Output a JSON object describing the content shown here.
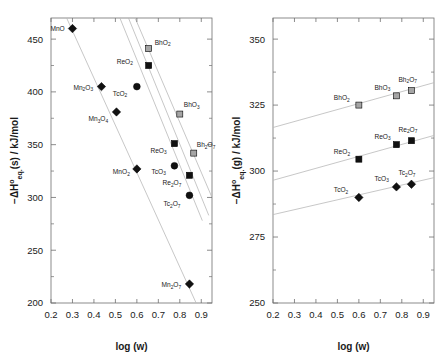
{
  "figure": {
    "panels": [
      "left",
      "right"
    ],
    "background": "#ffffff",
    "series_colors": {
      "Mn": "#111111",
      "Tc": "#111111",
      "Re": "#111111",
      "Bh": "#9a9a9a",
      "line": "#b9b9b9",
      "axis": "#6f6f6f"
    }
  },
  "chart_data": [
    {
      "type": "scatter",
      "panel": "left",
      "title": "",
      "xlabel": "log (w)",
      "ylabel": "−ΔH°eq(s) / kJ/mol",
      "ylabel_parts": {
        "prefix": "−ΔH",
        "sup": "o",
        "sub": "eq.",
        "state": "(s)",
        "units": " / kJ/mol"
      },
      "xlim": [
        0.2,
        0.95
      ],
      "ylim": [
        200,
        470
      ],
      "xticks": [
        0.2,
        0.3,
        0.4,
        0.5,
        0.6,
        0.7,
        0.8,
        0.9
      ],
      "xticklabels": [
        "0.2",
        "0.3",
        "0.4",
        "0.5",
        "0.6",
        "0.7",
        "0.8",
        "0.9"
      ],
      "yticks": [
        200,
        250,
        300,
        350,
        400,
        450
      ],
      "yticklabels": [
        "200",
        "250",
        "300",
        "350",
        "400",
        "450"
      ],
      "yminorticks": [
        225,
        275,
        325,
        375,
        425
      ],
      "grid": false,
      "legend": false,
      "series": [
        {
          "name": "Mn oxides",
          "marker": "diamond",
          "fill": "#111111",
          "points": [
            {
              "label": "MnO",
              "label_sub": "",
              "x": 0.3,
              "y": 460,
              "label_dx": -22,
              "label_dy": 2
            },
            {
              "label": "Mn",
              "label_sub": "2O3",
              "x": 0.435,
              "y": 405,
              "label_dx": -28,
              "label_dy": 3
            },
            {
              "label": "Mn",
              "label_sub": "3O4",
              "x": 0.505,
              "y": 381,
              "label_dx": -28,
              "label_dy": 9
            },
            {
              "label": "MnO",
              "label_sub": "2",
              "x": 0.6,
              "y": 327,
              "label_dx": -24,
              "label_dy": 5
            },
            {
              "label": "Mn",
              "label_sub": "2O7",
              "x": 0.845,
              "y": 218,
              "label_dx": -28,
              "label_dy": 3
            }
          ]
        },
        {
          "name": "Tc oxides",
          "marker": "circle",
          "fill": "#111111",
          "points": [
            {
              "label": "TcO",
              "label_sub": "2",
              "x": 0.6,
              "y": 405,
              "label_dx": -24,
              "label_dy": 9
            },
            {
              "label": "TcO",
              "label_sub": "3",
              "x": 0.775,
              "y": 330,
              "label_dx": -23,
              "label_dy": 8
            },
            {
              "label": "Tc",
              "label_sub": "2O7",
              "x": 0.845,
              "y": 302,
              "label_dx": -26,
              "label_dy": 11
            }
          ]
        },
        {
          "name": "Re oxides",
          "marker": "square",
          "fill": "#111111",
          "points": [
            {
              "label": "ReO",
              "label_sub": "2",
              "x": 0.655,
              "y": 425,
              "label_dx": -32,
              "label_dy": -2
            },
            {
              "label": "ReO",
              "label_sub": "3",
              "x": 0.775,
              "y": 351,
              "label_dx": -24,
              "label_dy": 9
            },
            {
              "label": "Re",
              "label_sub": "2O7",
              "x": 0.845,
              "y": 321,
              "label_dx": -27,
              "label_dy": 10
            }
          ]
        },
        {
          "name": "Bh oxides",
          "marker": "square",
          "fill": "#a5a5a5",
          "points": [
            {
              "label": "BhO",
              "label_sub": "2",
              "x": 0.655,
              "y": 441,
              "label_dx": 6,
              "label_dy": -4
            },
            {
              "label": "BhO",
              "label_sub": "3",
              "x": 0.8,
              "y": 379,
              "label_dx": 4,
              "label_dy": -7
            },
            {
              "label": "Bh",
              "label_sub": "2O7",
              "x": 0.865,
              "y": 342,
              "label_dx": 3,
              "label_dy": -6
            }
          ]
        }
      ],
      "trendlines": [
        {
          "name": "Mn",
          "x1": 0.255,
          "y1": 478,
          "x2": 0.885,
          "y2": 196
        },
        {
          "name": "Tc",
          "x1": 0.505,
          "y1": 478,
          "x2": 0.905,
          "y2": 278
        },
        {
          "name": "Re",
          "x1": 0.545,
          "y1": 478,
          "x2": 0.935,
          "y2": 283
        },
        {
          "name": "Bh",
          "x1": 0.575,
          "y1": 478,
          "x2": 0.95,
          "y2": 300
        }
      ]
    },
    {
      "type": "scatter",
      "panel": "right",
      "title": "",
      "xlabel": "log (w)",
      "ylabel": "−ΔH°eq(g) / kJ/mol",
      "ylabel_parts": {
        "prefix": "−ΔH",
        "sup": "o",
        "sub": "eq.",
        "state": "(g)",
        "units": " / kJ/mol"
      },
      "xlim": [
        0.2,
        0.95
      ],
      "ylim": [
        250,
        358
      ],
      "xticks": [
        0.2,
        0.3,
        0.4,
        0.5,
        0.6,
        0.7,
        0.8,
        0.9
      ],
      "xticklabels": [
        "0.2",
        "0.3",
        "0.4",
        "0.5",
        "0.6",
        "0.7",
        "0.8",
        "0.9"
      ],
      "yticks": [
        250,
        275,
        300,
        325,
        350
      ],
      "yticklabels": [
        "250",
        "275",
        "300",
        "325",
        "350"
      ],
      "yminorticks": [
        262.5,
        287.5,
        312.5,
        337.5
      ],
      "grid": false,
      "legend": false,
      "series": [
        {
          "name": "Bh oxides",
          "marker": "square",
          "fill": "#a5a5a5",
          "points": [
            {
              "label": "BhO",
              "label_sub": "2",
              "x": 0.6,
              "y": 325.0,
              "label_dx": -25,
              "label_dy": -5
            },
            {
              "label": "BhO",
              "label_sub": "3",
              "x": 0.775,
              "y": 328.5,
              "label_dx": -22,
              "label_dy": -6
            },
            {
              "label": "Bh",
              "label_sub": "2O7",
              "x": 0.845,
              "y": 330.5,
              "label_dx": -13,
              "label_dy": -9
            }
          ]
        },
        {
          "name": "Re oxides",
          "marker": "square",
          "fill": "#111111",
          "points": [
            {
              "label": "ReO",
              "label_sub": "2",
              "x": 0.6,
              "y": 304.5,
              "label_dx": -25,
              "label_dy": -5
            },
            {
              "label": "ReO",
              "label_sub": "3",
              "x": 0.775,
              "y": 310.0,
              "label_dx": -22,
              "label_dy": -6
            },
            {
              "label": "Re",
              "label_sub": "2O7",
              "x": 0.845,
              "y": 311.5,
              "label_dx": -13,
              "label_dy": -9
            }
          ]
        },
        {
          "name": "Tc oxides",
          "marker": "diamond",
          "fill": "#111111",
          "points": [
            {
              "label": "TcO",
              "label_sub": "2",
              "x": 0.6,
              "y": 290.0,
              "label_dx": -25,
              "label_dy": -5
            },
            {
              "label": "TcO",
              "label_sub": "3",
              "x": 0.775,
              "y": 294.0,
              "label_dx": -22,
              "label_dy": -6
            },
            {
              "label": "Tc",
              "label_sub": "2O7",
              "x": 0.845,
              "y": 295.0,
              "label_dx": -13,
              "label_dy": -9
            }
          ]
        }
      ],
      "trendlines": [
        {
          "name": "Bh",
          "x1": 0.2,
          "y1": 316.5,
          "x2": 0.95,
          "y2": 333.5
        },
        {
          "name": "Re",
          "x1": 0.2,
          "y1": 296.5,
          "x2": 0.95,
          "y2": 313.5
        },
        {
          "name": "Tc",
          "x1": 0.2,
          "y1": 283.5,
          "x2": 0.95,
          "y2": 297.5
        }
      ]
    }
  ]
}
